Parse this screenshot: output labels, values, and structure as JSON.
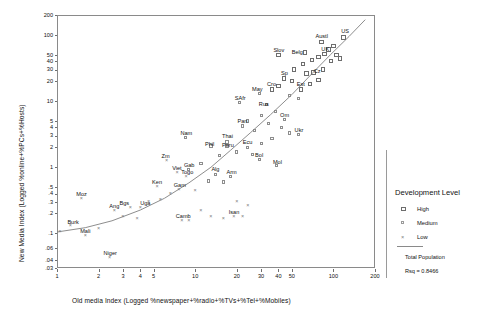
{
  "chart_data": {
    "type": "scatter",
    "title": "",
    "xlabel": "Old media Index (Logged %newspaper+%radio+%TVs+%Tel+%Mobiles)",
    "ylabel": "New Media Index (Logged %online+%PCs+%Hosts)",
    "xscale": "log",
    "yscale": "log",
    "xlim": [
      1,
      200
    ],
    "ylim": [
      0.03,
      200
    ],
    "grid": false,
    "xticks": [
      "1",
      "2",
      "3",
      "4",
      "5",
      "10",
      "20",
      "30",
      "40",
      "50",
      "100",
      "200"
    ],
    "xtick_values": [
      1,
      2,
      3,
      4,
      5,
      10,
      20,
      30,
      40,
      50,
      100,
      200
    ],
    "yticks": [
      "200",
      "100",
      "50",
      "40",
      "30",
      "20",
      "10",
      "5",
      "4",
      "3",
      "2",
      "1",
      ".5",
      ".4",
      ".3",
      ".2",
      ".1",
      ".06",
      ".04",
      ".03"
    ],
    "ytick_values": [
      200,
      100,
      50,
      40,
      30,
      20,
      10,
      5,
      4,
      3,
      2,
      1,
      0.5,
      0.4,
      0.3,
      0.2,
      0.1,
      0.06,
      0.04,
      0.03
    ],
    "legend_position": "right",
    "fit_line": {
      "label": "Total Population",
      "rsq_label": "Rsq = 0.8466",
      "rsq": 0.8466
    },
    "series": [
      {
        "name": "High",
        "marker": "open-square-large"
      },
      {
        "name": "Medium",
        "marker": "open-square-small"
      },
      {
        "name": "Low",
        "marker": "x-cross"
      }
    ],
    "points": [
      {
        "label": "Austl",
        "x": 82,
        "y": 78,
        "group": "High",
        "lx": -6,
        "ly": -9
      },
      {
        "label": "US",
        "x": 118,
        "y": 92,
        "group": "High",
        "lx": -2,
        "ly": -9
      },
      {
        "label": "UK",
        "x": 86,
        "y": 52,
        "group": "High",
        "lx": -3,
        "ly": -8
      },
      {
        "label": "Belg",
        "x": 62,
        "y": 54,
        "group": "High",
        "lx": -13,
        "ly": -4
      },
      {
        "label": "Slov",
        "x": 40,
        "y": 50,
        "group": "High",
        "lx": -5,
        "ly": -8
      },
      {
        "label": "Sp",
        "x": 44,
        "y": 22,
        "group": "High",
        "lx": -3,
        "ly": -8
      },
      {
        "label": "Cz",
        "x": 72,
        "y": 27,
        "group": "High",
        "lx": 0,
        "ly": -5
      },
      {
        "label": "Est",
        "x": 58,
        "y": 15,
        "group": "High",
        "lx": -4,
        "ly": -8
      },
      {
        "label": "Cro",
        "x": 36,
        "y": 15,
        "group": "High",
        "lx": -5,
        "ly": -8
      },
      {
        "label": "May",
        "x": 29,
        "y": 13,
        "group": "Medium",
        "lx": -7,
        "ly": -8
      },
      {
        "label": "Rus",
        "x": 33,
        "y": 9.0,
        "group": "Medium",
        "lx": -8,
        "ly": -3
      },
      {
        "label": "SAfr",
        "x": 21,
        "y": 9.5,
        "group": "Medium",
        "lx": -5,
        "ly": -8
      },
      {
        "label": "Om",
        "x": 44,
        "y": 5.2,
        "group": "Medium",
        "lx": -4,
        "ly": -8
      },
      {
        "label": "Pan",
        "x": 22,
        "y": 4.2,
        "group": "Medium",
        "lx": -5,
        "ly": -8
      },
      {
        "label": "Ukr",
        "x": 56,
        "y": 3.1,
        "group": "Medium",
        "lx": -4,
        "ly": -8
      },
      {
        "label": "Thai",
        "x": 17,
        "y": 2.4,
        "group": "Medium",
        "lx": -5,
        "ly": -9
      },
      {
        "label": "Peru",
        "x": 17,
        "y": 2.1,
        "group": "Medium",
        "lx": -5,
        "ly": -4
      },
      {
        "label": "Ecu",
        "x": 24,
        "y": 2.0,
        "group": "Medium",
        "lx": -5,
        "ly": -8
      },
      {
        "label": "Phil",
        "x": 13,
        "y": 2.1,
        "group": "Medium",
        "lx": -6,
        "ly": -5
      },
      {
        "label": "Nam",
        "x": 8.5,
        "y": 2.8,
        "group": "Medium",
        "lx": -5,
        "ly": -8
      },
      {
        "label": "Bol",
        "x": 29,
        "y": 1.3,
        "group": "Medium",
        "lx": -4,
        "ly": -8
      },
      {
        "label": "Mol",
        "x": 39,
        "y": 1.05,
        "group": "Medium",
        "lx": -4,
        "ly": -7
      },
      {
        "label": "Arm",
        "x": 18,
        "y": 0.72,
        "group": "Medium",
        "lx": -4,
        "ly": -8
      },
      {
        "label": "Alg",
        "x": 14,
        "y": 0.78,
        "group": "Medium",
        "lx": -4,
        "ly": -8
      },
      {
        "label": "Gab",
        "x": 9.0,
        "y": 0.92,
        "group": "Medium",
        "lx": -5,
        "ly": -8
      },
      {
        "label": "Zm",
        "x": 6.2,
        "y": 1.25,
        "group": "Low",
        "lx": -5,
        "ly": -8
      },
      {
        "label": "Viet",
        "x": 7.4,
        "y": 0.82,
        "group": "Low",
        "lx": -5,
        "ly": -8
      },
      {
        "label": "Togo",
        "x": 8.6,
        "y": 0.72,
        "group": "Low",
        "lx": -5,
        "ly": -8
      },
      {
        "label": "Ken",
        "x": 5.3,
        "y": 0.5,
        "group": "Low",
        "lx": -5,
        "ly": -8
      },
      {
        "label": "Gam",
        "x": 7.6,
        "y": 0.46,
        "group": "Low",
        "lx": -5,
        "ly": -8
      },
      {
        "label": "Uga",
        "x": 4.0,
        "y": 0.24,
        "group": "Low",
        "lx": 0,
        "ly": -8
      },
      {
        "label": "Bgs",
        "x": 3.4,
        "y": 0.24,
        "group": "Low",
        "lx": -11,
        "ly": -8
      },
      {
        "label": "Ang",
        "x": 2.6,
        "y": 0.22,
        "group": "Low",
        "lx": -5,
        "ly": -8
      },
      {
        "label": "Moz",
        "x": 1.5,
        "y": 0.33,
        "group": "Low",
        "lx": -5,
        "ly": -8
      },
      {
        "label": "Burk",
        "x": 1.25,
        "y": 0.13,
        "group": "Low",
        "lx": -3,
        "ly": -7
      },
      {
        "label": "Mali",
        "x": 1.6,
        "y": 0.092,
        "group": "Low",
        "lx": -5,
        "ly": -8
      },
      {
        "label": "Niger",
        "x": 2.4,
        "y": 0.043,
        "group": "Low",
        "lx": -6,
        "ly": -8
      },
      {
        "label": "Camb",
        "x": 8.0,
        "y": 0.155,
        "group": "Low",
        "lx": -6,
        "ly": -8
      },
      {
        "label": "Isan",
        "x": 19,
        "y": 0.175,
        "group": "Low",
        "lx": -5,
        "ly": -8
      },
      {
        "label": "",
        "x": 100,
        "y": 68,
        "group": "High"
      },
      {
        "label": "",
        "x": 92,
        "y": 60,
        "group": "High"
      },
      {
        "label": "",
        "x": 105,
        "y": 50,
        "group": "High"
      },
      {
        "label": "",
        "x": 78,
        "y": 46,
        "group": "High"
      },
      {
        "label": "",
        "x": 70,
        "y": 42,
        "group": "High"
      },
      {
        "label": "",
        "x": 96,
        "y": 40,
        "group": "High"
      },
      {
        "label": "",
        "x": 60,
        "y": 36,
        "group": "High"
      },
      {
        "label": "",
        "x": 112,
        "y": 44,
        "group": "High"
      },
      {
        "label": "",
        "x": 52,
        "y": 30,
        "group": "High"
      },
      {
        "label": "",
        "x": 64,
        "y": 26,
        "group": "High"
      },
      {
        "label": "",
        "x": 84,
        "y": 30,
        "group": "High"
      },
      {
        "label": "",
        "x": 50,
        "y": 20,
        "group": "High"
      },
      {
        "label": "",
        "x": 68,
        "y": 18,
        "group": "High"
      },
      {
        "label": "",
        "x": 78,
        "y": 21,
        "group": "High"
      },
      {
        "label": "",
        "x": 40,
        "y": 17,
        "group": "High"
      },
      {
        "label": "",
        "x": 56,
        "y": 11,
        "group": "Medium"
      },
      {
        "label": "",
        "x": 48,
        "y": 12,
        "group": "Medium"
      },
      {
        "label": "",
        "x": 38,
        "y": 7.0,
        "group": "Medium"
      },
      {
        "label": "",
        "x": 30,
        "y": 6.0,
        "group": "Medium"
      },
      {
        "label": "",
        "x": 34,
        "y": 4.6,
        "group": "Medium"
      },
      {
        "label": "",
        "x": 42,
        "y": 4.0,
        "group": "Medium"
      },
      {
        "label": "",
        "x": 27,
        "y": 3.6,
        "group": "Medium"
      },
      {
        "label": "",
        "x": 48,
        "y": 3.3,
        "group": "Medium"
      },
      {
        "label": "",
        "x": 24,
        "y": 5.0,
        "group": "Medium"
      },
      {
        "label": "",
        "x": 36,
        "y": 2.7,
        "group": "Medium"
      },
      {
        "label": "",
        "x": 30,
        "y": 2.3,
        "group": "Medium"
      },
      {
        "label": "",
        "x": 20,
        "y": 1.7,
        "group": "Medium"
      },
      {
        "label": "",
        "x": 26,
        "y": 1.55,
        "group": "Medium"
      },
      {
        "label": "",
        "x": 15,
        "y": 1.5,
        "group": "Medium"
      },
      {
        "label": "",
        "x": 11,
        "y": 1.15,
        "group": "Medium"
      },
      {
        "label": "",
        "x": 12.5,
        "y": 0.62,
        "group": "Medium"
      },
      {
        "label": "",
        "x": 16,
        "y": 0.6,
        "group": "Medium"
      },
      {
        "label": "",
        "x": 10,
        "y": 0.44,
        "group": "Low"
      },
      {
        "label": "",
        "x": 6.6,
        "y": 0.4,
        "group": "Low"
      },
      {
        "label": "",
        "x": 5.6,
        "y": 0.32,
        "group": "Low"
      },
      {
        "label": "",
        "x": 4.6,
        "y": 0.3,
        "group": "Low"
      },
      {
        "label": "",
        "x": 3.0,
        "y": 0.175,
        "group": "Low"
      },
      {
        "label": "",
        "x": 3.8,
        "y": 0.165,
        "group": "Low"
      },
      {
        "label": "",
        "x": 13,
        "y": 0.175,
        "group": "Low"
      },
      {
        "label": "",
        "x": 16,
        "y": 0.165,
        "group": "Low"
      },
      {
        "label": "",
        "x": 22,
        "y": 0.18,
        "group": "Low"
      },
      {
        "label": "",
        "x": 11,
        "y": 0.22,
        "group": "Low"
      },
      {
        "label": "",
        "x": 9.0,
        "y": 0.155,
        "group": "Low"
      },
      {
        "label": "",
        "x": 2.0,
        "y": 0.115,
        "group": "Low"
      },
      {
        "label": "",
        "x": 1.05,
        "y": 0.105,
        "group": "Low"
      },
      {
        "label": "",
        "x": 20,
        "y": 0.3,
        "group": "Low"
      },
      {
        "label": "",
        "x": 24,
        "y": 0.26,
        "group": "Low"
      }
    ],
    "curve": [
      {
        "x": 1.0,
        "y": 0.105
      },
      {
        "x": 1.6,
        "y": 0.122
      },
      {
        "x": 2.5,
        "y": 0.155
      },
      {
        "x": 4.0,
        "y": 0.225
      },
      {
        "x": 6.0,
        "y": 0.34
      },
      {
        "x": 9.0,
        "y": 0.58
      },
      {
        "x": 13.0,
        "y": 1.0
      },
      {
        "x": 18.0,
        "y": 1.8
      },
      {
        "x": 25.0,
        "y": 3.3
      },
      {
        "x": 35.0,
        "y": 6.2
      },
      {
        "x": 50.0,
        "y": 12.5
      },
      {
        "x": 70.0,
        "y": 26.0
      },
      {
        "x": 95.0,
        "y": 50.0
      },
      {
        "x": 130.0,
        "y": 95.0
      },
      {
        "x": 170.0,
        "y": 170.0
      }
    ]
  },
  "legend": {
    "title": "Development Level",
    "items": [
      {
        "label": "High",
        "marker": "open-square-large"
      },
      {
        "label": "Medium",
        "marker": "open-square-small"
      },
      {
        "label": "Low",
        "marker": "x-cross"
      }
    ],
    "fit_label": "Total Population",
    "rsq_label": "Rsq = 0.8466"
  }
}
